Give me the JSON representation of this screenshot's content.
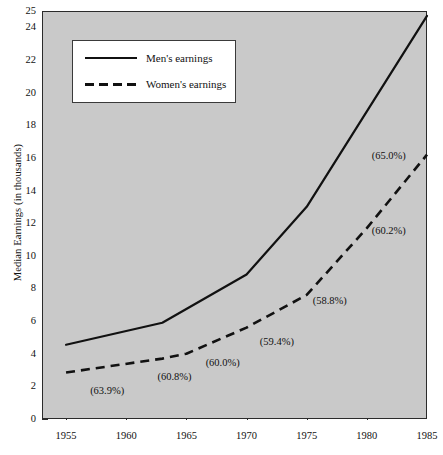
{
  "chart_data": {
    "type": "line",
    "title": "",
    "xlabel": "",
    "ylabel": "Median Earnings (in thousands)",
    "xlim": [
      1953,
      1985
    ],
    "ylim": [
      0,
      25
    ],
    "grid": false,
    "plot_background": "#c9c9c9",
    "line_color": "#111111",
    "legend_position": "upper-left",
    "x_ticks": [
      1955,
      1960,
      1965,
      1970,
      1975,
      1980,
      1985
    ],
    "y_ticks": [
      0,
      2,
      4,
      6,
      8,
      10,
      12,
      14,
      16,
      18,
      20,
      22,
      24,
      25
    ],
    "series": [
      {
        "name": "Men's earnings",
        "style": "solid",
        "x": [
          1955,
          1963,
          1970,
          1975,
          1985
        ],
        "values": [
          4.55,
          5.9,
          8.85,
          13.0,
          24.7
        ]
      },
      {
        "name": "Women's earnings",
        "style": "dashed",
        "x": [
          1955,
          1963,
          1965,
          1970,
          1975,
          1980,
          1985
        ],
        "values": [
          2.85,
          3.7,
          4.0,
          5.6,
          7.6,
          11.7,
          16.2
        ]
      }
    ],
    "annotations": [
      {
        "text": "(63.9%)",
        "x": 1957.0,
        "y": 2.0,
        "label": "ratio-1955"
      },
      {
        "text": "(60.8%)",
        "x": 1962.6,
        "y": 2.85,
        "label": "ratio-1963"
      },
      {
        "text": "(60.0%)",
        "x": 1966.6,
        "y": 3.75,
        "label": "ratio-1965"
      },
      {
        "text": "(59.4%)",
        "x": 1971.1,
        "y": 5.05,
        "label": "ratio-1970"
      },
      {
        "text": "(58.8%)",
        "x": 1975.5,
        "y": 7.55,
        "label": "ratio-1975"
      },
      {
        "text": "(60.2%)",
        "x": 1980.4,
        "y": 11.8,
        "label": "ratio-1980"
      },
      {
        "text": "(65.0%)",
        "x": 1980.4,
        "y": 16.4,
        "label": "ratio-1985"
      }
    ]
  },
  "legend": {
    "items": [
      {
        "label": "Men's earnings",
        "style": "solid"
      },
      {
        "label": "Women's earnings",
        "style": "dashed"
      }
    ]
  }
}
